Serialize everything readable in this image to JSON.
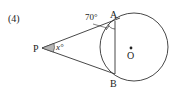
{
  "problem_number": "(4)",
  "points": {
    "P": "P",
    "A": "A",
    "B": "B",
    "O": "O"
  },
  "angles": {
    "given": "70°",
    "unknown": "x°"
  },
  "colors": {
    "stroke": "#333333",
    "angle_fill": "#b5b5b5"
  }
}
